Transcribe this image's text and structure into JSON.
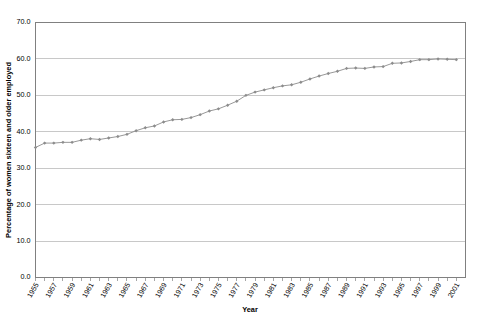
{
  "chart_data": {
    "type": "line",
    "title": "",
    "subtitle": "",
    "xlabel": "Year",
    "ylabel": "Percentage of women sixteen and older employed",
    "xlim": [
      1955,
      2002
    ],
    "ylim": [
      0.0,
      70.0
    ],
    "y_ticks": [
      "0.0",
      "10.0",
      "20.0",
      "30.0",
      "40.0",
      "50.0",
      "60.0",
      "70.0"
    ],
    "y_tick_values": [
      0.0,
      10.0,
      20.0,
      30.0,
      40.0,
      50.0,
      60.0,
      70.0
    ],
    "x_tick_labels": [
      "1955",
      "1957",
      "1959",
      "1961",
      "1963",
      "1965",
      "1967",
      "1969",
      "1971",
      "1973",
      "1975",
      "1977",
      "1979",
      "1981",
      "1983",
      "1985",
      "1987",
      "1989",
      "1991",
      "1993",
      "1995",
      "1997",
      "1999",
      "2001"
    ],
    "grid": "horizontal",
    "legend": "none",
    "marker": "diamond",
    "line_color": "#8c8c8c",
    "x": [
      1955,
      1956,
      1957,
      1958,
      1959,
      1960,
      1961,
      1962,
      1963,
      1964,
      1965,
      1966,
      1967,
      1968,
      1969,
      1970,
      1971,
      1972,
      1973,
      1974,
      1975,
      1976,
      1977,
      1978,
      1979,
      1980,
      1981,
      1982,
      1983,
      1984,
      1985,
      1986,
      1987,
      1988,
      1989,
      1990,
      1991,
      1992,
      1993,
      1994,
      1995,
      1996,
      1997,
      1998,
      1999,
      2000,
      2001
    ],
    "series": [
      {
        "name": "Percentage of women sixteen and older employed",
        "values": [
          35.7,
          36.9,
          36.9,
          37.1,
          37.1,
          37.7,
          38.1,
          37.9,
          38.3,
          38.7,
          39.3,
          40.3,
          41.1,
          41.6,
          42.7,
          43.3,
          43.4,
          43.9,
          44.7,
          45.7,
          46.3,
          47.3,
          48.4,
          50.0,
          50.9,
          51.5,
          52.1,
          52.6,
          52.9,
          53.6,
          54.5,
          55.3,
          56.0,
          56.6,
          57.4,
          57.5,
          57.4,
          57.8,
          57.9,
          58.8,
          58.9,
          59.3,
          59.8,
          59.8,
          60.0,
          59.9,
          59.8
        ]
      }
    ]
  },
  "axes": {
    "y_title": "Percentage of women sixteen and older employed",
    "x_title": "Year"
  }
}
